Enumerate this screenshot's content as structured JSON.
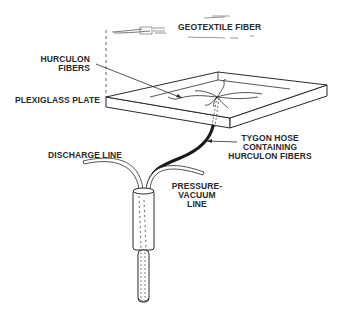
{
  "diagram": {
    "labels": {
      "geotextile_fiber": "GEOTEXTILE FIBER",
      "hurculon_fibers_line1": "HURCULON",
      "hurculon_fibers_line2": "FIBERS",
      "plexiglass_plate": "PLEXIGLASS PLATE",
      "tygon_hose_line1": "TYGON HOSE",
      "tygon_hose_line2": "CONTAINING",
      "tygon_hose_line3": "HURCULON FIBERS",
      "discharge_line": "DISCHARGE LINE",
      "pressure_vacuum_line1": "PRESSURE-",
      "pressure_vacuum_line2": "VACUUM",
      "pressure_vacuum_line3": "LINE"
    },
    "colors": {
      "ink": "#2a2a2a",
      "background": "#ffffff"
    }
  }
}
